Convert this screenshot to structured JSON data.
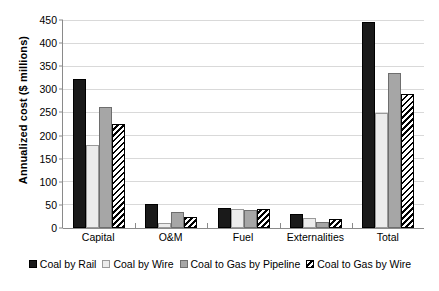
{
  "chart_data": {
    "type": "bar",
    "title": "",
    "xlabel": "",
    "ylabel": "Annualized cost ($ millions)",
    "ylim": [
      0,
      450
    ],
    "ytick_step": 50,
    "yticks": [
      0,
      50,
      100,
      150,
      200,
      250,
      300,
      350,
      400,
      450
    ],
    "grid": true,
    "legend_position": "bottom",
    "categories": [
      "Capital",
      "O&M",
      "Fuel",
      "Externalities",
      "Total"
    ],
    "series": [
      {
        "name": "Coal by Rail",
        "pattern": "solid-black",
        "color": "#1a1a1a",
        "values": [
          323,
          52,
          44,
          30,
          445
        ]
      },
      {
        "name": "Coal by Wire",
        "pattern": "solid-light",
        "color": "#ececec",
        "values": [
          180,
          11,
          41,
          22,
          248
        ]
      },
      {
        "name": "Coal to Gas by Pipeline",
        "pattern": "solid-gray",
        "color": "#a6a6a6",
        "values": [
          262,
          35,
          39,
          12,
          335
        ]
      },
      {
        "name": "Coal to Gas by Wire",
        "pattern": "diagonal-hatch",
        "color": "#000000",
        "values": [
          225,
          23,
          41,
          20,
          290
        ]
      }
    ]
  }
}
